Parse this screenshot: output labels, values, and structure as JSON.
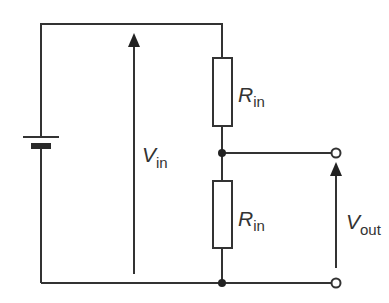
{
  "diagram": {
    "type": "circuit",
    "colors": {
      "line": "#333333",
      "background": "#ffffff"
    },
    "components": {
      "battery": {
        "label": ""
      },
      "resistor_top": {
        "symbol": "R",
        "subscript": "in"
      },
      "resistor_bottom": {
        "symbol": "R",
        "subscript": "in"
      }
    },
    "voltages": {
      "input": {
        "symbol": "V",
        "subscript": "in"
      },
      "output": {
        "symbol": "V",
        "subscript": "out"
      }
    },
    "nodes": [
      "junction-middle",
      "junction-bottom",
      "terminal-top",
      "terminal-bottom"
    ]
  }
}
